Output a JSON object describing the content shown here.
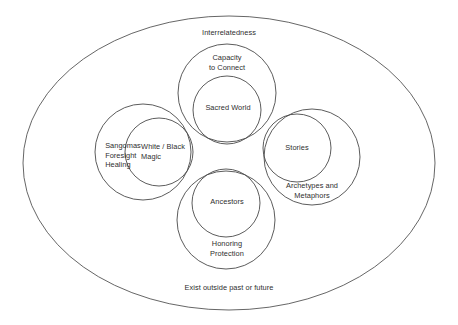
{
  "diagram": {
    "title_top": "Interrelatedness",
    "title_bottom": "Exist outside past or future",
    "container": {
      "name": "outer-ellipse",
      "shape": "ellipse",
      "cx": 229,
      "cy": 163,
      "rx": 206,
      "ry": 147
    },
    "petals": [
      {
        "id": "top",
        "outer_label": "Capacity\nto Connect",
        "inner_label": "Sacred World",
        "outer": {
          "cx": 227,
          "cy": 93,
          "r": 49
        },
        "inner": {
          "cx": 227,
          "cy": 110,
          "r": 34
        },
        "outer_label_pos": {
          "x": 227,
          "y": 63
        },
        "inner_label_pos": {
          "x": 228,
          "y": 108
        }
      },
      {
        "id": "left",
        "outer_label": "Sangomas\nForesight\nHealing",
        "inner_label": "White / Black\nMagic",
        "outer": {
          "cx": 143,
          "cy": 152,
          "r": 48
        },
        "inner": {
          "cx": 159,
          "cy": 152,
          "r": 34
        },
        "outer_label_pos": {
          "x": 123,
          "y": 155
        },
        "inner_label_pos": {
          "x": 163,
          "y": 152
        }
      },
      {
        "id": "right",
        "outer_label": "Archetypes and\nMetaphors",
        "inner_label": "Stories",
        "outer": {
          "cx": 312,
          "cy": 157,
          "r": 48
        },
        "inner": {
          "cx": 297,
          "cy": 148,
          "r": 34
        },
        "outer_label_pos": {
          "x": 312,
          "y": 191
        },
        "inner_label_pos": {
          "x": 297,
          "y": 148
        }
      },
      {
        "id": "bottom",
        "outer_label": "Honoring\nProtection",
        "inner_label": "Ancestors",
        "outer": {
          "cx": 226,
          "cy": 220,
          "r": 49
        },
        "inner": {
          "cx": 226,
          "cy": 203,
          "r": 34
        },
        "outer_label_pos": {
          "x": 227,
          "y": 249
        },
        "inner_label_pos": {
          "x": 227,
          "y": 202
        }
      }
    ],
    "top_label_pos": {
      "x": 229,
      "y": 33
    },
    "bottom_label_pos": {
      "x": 229,
      "y": 288
    },
    "colors": {
      "stroke": "#4a4a4a",
      "text": "#2e2e2e",
      "background": "#ffffff"
    }
  }
}
